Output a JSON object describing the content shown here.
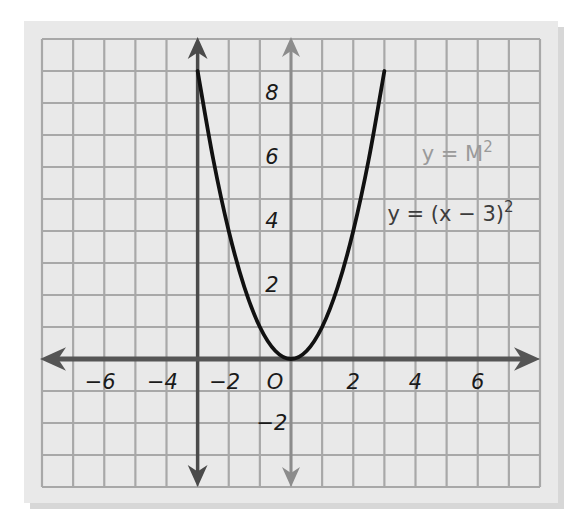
{
  "chart_data": {
    "type": "line",
    "title": "",
    "xlabel": "",
    "ylabel": "",
    "xlim": [
      -8,
      8
    ],
    "ylim": [
      -4,
      10
    ],
    "grid": true,
    "x_ticks": [
      -6,
      -4,
      -2,
      0,
      2,
      4,
      6
    ],
    "x_tick_labels": [
      "−6",
      "−4",
      "−2",
      "O",
      "2",
      "4",
      "6"
    ],
    "y_ticks": [
      -2,
      2,
      4,
      6,
      8
    ],
    "y_tick_labels": [
      "−2",
      "2",
      "4",
      "6",
      "8"
    ],
    "series": [
      {
        "name": "y = x^2",
        "color": "#111111",
        "x": [
          -3,
          -2.5,
          -2,
          -1.5,
          -1,
          -0.5,
          0,
          0.5,
          1,
          1.5,
          2,
          2.5,
          3
        ],
        "y": [
          9,
          6.25,
          4,
          2.25,
          1,
          0.25,
          0,
          0.25,
          1,
          2.25,
          4,
          6.25,
          9
        ]
      }
    ],
    "reference_lines": [
      {
        "name": "x = -3 vertical line",
        "x": -3,
        "color": "#4a4a4a",
        "arrows": "both"
      }
    ],
    "annotations": [
      {
        "text": "y = M",
        "sup": "2",
        "x": 4.2,
        "y": 6.2,
        "color": "#9a9a9a"
      },
      {
        "text": "y = (x − 3)",
        "sup": "2",
        "x": 3.1,
        "y": 4.3,
        "color": "#3c3c3c"
      }
    ],
    "colors": {
      "page_bg": "#ffffff",
      "panel_bg": "#e9e9e9",
      "panel_shadow": "#b8b8b8",
      "grid": "#a8a8a8",
      "x_axis": "#555555",
      "y_axis": "#8c8c8c"
    }
  }
}
